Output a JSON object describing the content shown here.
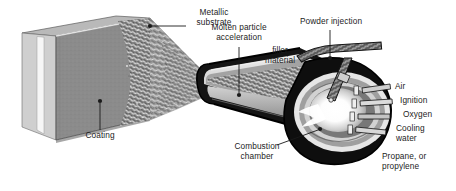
{
  "figure": {
    "type": "technical-cutaway-diagram",
    "background_color": "#ffffff",
    "text_color": "#1d1d1d",
    "leader_line_color": "#1a1a1a"
  },
  "labels": {
    "metallic_substrate": "Metallic\nsubstrate",
    "coating": "Coating",
    "molten_particle_acceleration": "Molten particle\nacceleration",
    "filler_material": "filler\nmaterial",
    "powder_injection": "Powder injection",
    "combustion_chamber": "Combustion\nchamber",
    "air": "Air",
    "ignition": "Ignition",
    "oxygen": "Oxygen",
    "cooling_water": "Cooling\nwater",
    "propane_or_propylene": "Propane, or\npropylene"
  },
  "parts": {
    "substrate_plate": "metallic substrate plate",
    "coating_layer": "deposited coating surface",
    "spray_plume": "molten particle spray plume",
    "barrel": "gun barrel / nozzle",
    "combustion_bulb": "combustion chamber bulb",
    "flame_core": "flame core",
    "powder_tube": "powder injection tube",
    "gas_ports": "gas and water feed ports"
  },
  "colors": {
    "plate_face": "#8a8a8a",
    "plate_edge": "#f2f2f2",
    "plume": "#9b9b9b",
    "barrel_outer": "#151515",
    "barrel_mid": "#c9c9c9",
    "barrel_core": "#4a4a4a",
    "chamber_dark": "#101010",
    "flame_white": "#ffffff"
  }
}
